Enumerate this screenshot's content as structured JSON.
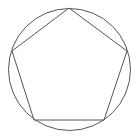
{
  "diagram": {
    "title": "",
    "background": "#ffffff",
    "stroke_color": "#555555",
    "circle": {
      "cx": 69.5,
      "cy": 69.5,
      "r": 61
    },
    "pentagon": {
      "points": "69,8 127,51 104,120 34,120 12,51"
    }
  }
}
